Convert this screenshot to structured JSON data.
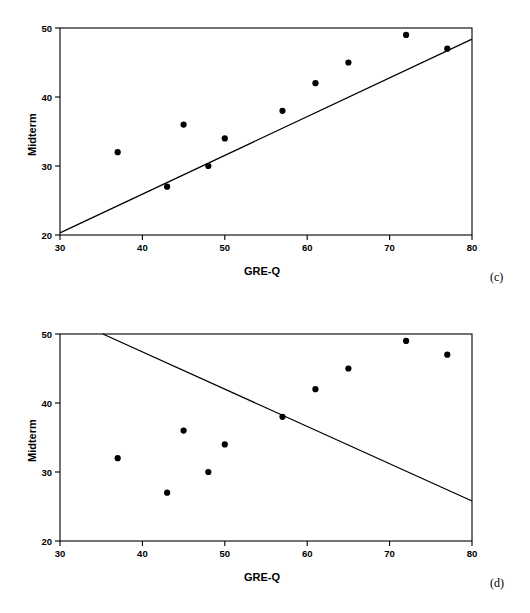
{
  "figure": {
    "background_color": "#ffffff",
    "ink_color": "#000000"
  },
  "panels": [
    {
      "id": "c",
      "label": "(c)",
      "xlabel": "GRE-Q",
      "ylabel": "Midterm"
    },
    {
      "id": "d",
      "label": "(d)",
      "xlabel": "GRE-Q",
      "ylabel": "Midterm"
    }
  ],
  "chart_data": [
    {
      "type": "scatter",
      "title": "",
      "panel_label": "(c)",
      "xlabel": "GRE-Q",
      "ylabel": "Midterm",
      "xlim": [
        30,
        80
      ],
      "ylim": [
        20,
        50
      ],
      "xticks": [
        30,
        40,
        50,
        60,
        70,
        80
      ],
      "yticks": [
        20,
        30,
        40,
        50
      ],
      "xtick_labels": [
        "30",
        "40",
        "50",
        "60",
        "70",
        "80"
      ],
      "ytick_labels": [
        "20",
        "30",
        "40",
        "50"
      ],
      "grid": false,
      "legend": null,
      "marker": "filled-circle",
      "marker_color": "#000000",
      "points": [
        {
          "x": 37,
          "y": 32
        },
        {
          "x": 43,
          "y": 27
        },
        {
          "x": 45,
          "y": 36
        },
        {
          "x": 48,
          "y": 30
        },
        {
          "x": 50,
          "y": 34
        },
        {
          "x": 57,
          "y": 38
        },
        {
          "x": 61,
          "y": 42
        },
        {
          "x": 65,
          "y": 45
        },
        {
          "x": 72,
          "y": 49
        },
        {
          "x": 77,
          "y": 47
        }
      ],
      "line": {
        "name": "fitted line (positive slope)",
        "color": "#000000",
        "x1": 30,
        "y1": 20.3,
        "x2": 80,
        "y2": 48.4
      }
    },
    {
      "type": "scatter",
      "title": "",
      "panel_label": "(d)",
      "xlabel": "GRE-Q",
      "ylabel": "Midterm",
      "xlim": [
        30,
        80
      ],
      "ylim": [
        20,
        50
      ],
      "xticks": [
        30,
        40,
        50,
        60,
        70,
        80
      ],
      "yticks": [
        20,
        30,
        40,
        50
      ],
      "xtick_labels": [
        "30",
        "40",
        "50",
        "60",
        "70",
        "80"
      ],
      "ytick_labels": [
        "20",
        "30",
        "40",
        "50"
      ],
      "grid": false,
      "legend": null,
      "marker": "filled-circle",
      "marker_color": "#000000",
      "points": [
        {
          "x": 37,
          "y": 32
        },
        {
          "x": 43,
          "y": 27
        },
        {
          "x": 45,
          "y": 36
        },
        {
          "x": 48,
          "y": 30
        },
        {
          "x": 50,
          "y": 34
        },
        {
          "x": 57,
          "y": 38
        },
        {
          "x": 61,
          "y": 42
        },
        {
          "x": 65,
          "y": 45
        },
        {
          "x": 72,
          "y": 49
        },
        {
          "x": 77,
          "y": 47
        }
      ],
      "line": {
        "name": "fitted line (negative slope)",
        "color": "#000000",
        "x1": 35.2,
        "y1": 50,
        "x2": 80,
        "y2": 25.8
      }
    }
  ]
}
